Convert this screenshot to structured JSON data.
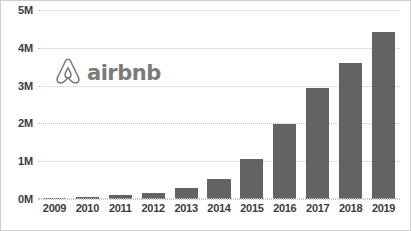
{
  "brand": {
    "name": "airbnb",
    "logo_icon": "airbnb-belo-icon",
    "color": "#7b7b7b"
  },
  "colors": {
    "bar": "#636363",
    "gridline": "#c9c9c9",
    "text": "#3c3c3c",
    "background": "#ffffff"
  },
  "chart_data": {
    "type": "bar",
    "title": "",
    "xlabel": "",
    "ylabel": "",
    "categories": [
      "2009",
      "2010",
      "2011",
      "2012",
      "2013",
      "2014",
      "2015",
      "2016",
      "2017",
      "2018",
      "2019"
    ],
    "values": [
      0.01,
      0.05,
      0.1,
      0.15,
      0.28,
      0.52,
      1.05,
      1.98,
      2.95,
      3.6,
      4.42
    ],
    "value_unit": "M",
    "ylim": [
      0,
      5
    ],
    "ytick_values": [
      0,
      1,
      2,
      3,
      4,
      5
    ],
    "ytick_labels": [
      "0M",
      "1M",
      "2M",
      "3M",
      "4M",
      "5M"
    ],
    "grid": true,
    "grid_style": "dotted-horizontal",
    "legend": "none",
    "annotations": [
      "airbnb"
    ]
  }
}
